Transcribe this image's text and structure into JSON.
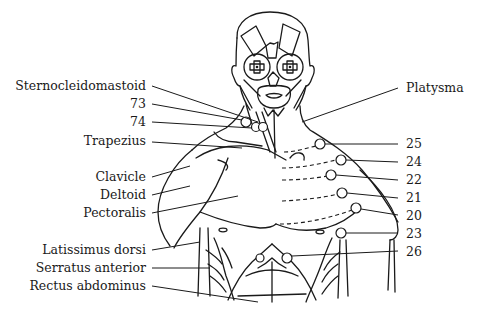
{
  "diagram": {
    "type": "anatomical-muscle-chart",
    "left_labels": [
      {
        "id": "sternocleidomastoid",
        "text": "Sternocleidomastoid",
        "x": 146,
        "y": 90
      },
      {
        "id": "73",
        "text": "73",
        "x": 146,
        "y": 108
      },
      {
        "id": "74",
        "text": "74",
        "x": 146,
        "y": 126
      },
      {
        "id": "trapezius",
        "text": "Trapezius",
        "x": 146,
        "y": 145
      },
      {
        "id": "clavicle",
        "text": "Clavicle",
        "x": 146,
        "y": 181
      },
      {
        "id": "deltoid",
        "text": "Deltoid",
        "x": 146,
        "y": 199
      },
      {
        "id": "pectoralis",
        "text": "Pectoralis",
        "x": 146,
        "y": 217
      },
      {
        "id": "latissimus-dorsi",
        "text": "Latissimus dorsi",
        "x": 146,
        "y": 254
      },
      {
        "id": "serratus-anterior",
        "text": "Serratus anterior",
        "x": 146,
        "y": 272
      },
      {
        "id": "rectus-abdominus",
        "text": "Rectus abdominus",
        "x": 146,
        "y": 290
      }
    ],
    "right_labels": [
      {
        "id": "platysma",
        "text": "Platysma",
        "x": 406,
        "y": 92
      },
      {
        "id": "25",
        "text": "25",
        "x": 406,
        "y": 148
      },
      {
        "id": "24",
        "text": "24",
        "x": 406,
        "y": 166
      },
      {
        "id": "22",
        "text": "22",
        "x": 406,
        "y": 184
      },
      {
        "id": "21",
        "text": "21",
        "x": 406,
        "y": 202
      },
      {
        "id": "20",
        "text": "20",
        "x": 406,
        "y": 220
      },
      {
        "id": "23",
        "text": "23",
        "x": 406,
        "y": 238
      },
      {
        "id": "26",
        "text": "26",
        "x": 406,
        "y": 256
      }
    ],
    "points": [
      {
        "id": "73",
        "cx": 246,
        "cy": 122
      },
      {
        "id": "74",
        "cx": 258,
        "cy": 126
      },
      {
        "id": "74b",
        "cx": 263,
        "cy": 127
      },
      {
        "id": "25",
        "cx": 320,
        "cy": 144
      },
      {
        "id": "24",
        "cx": 341,
        "cy": 160
      },
      {
        "id": "22",
        "cx": 331,
        "cy": 175
      },
      {
        "id": "21",
        "cx": 342,
        "cy": 193
      },
      {
        "id": "20",
        "cx": 356,
        "cy": 208
      },
      {
        "id": "23",
        "cx": 341,
        "cy": 233
      },
      {
        "id": "26",
        "cx": 287,
        "cy": 258
      }
    ],
    "colors": {
      "ink": "#1a1a1a",
      "background": "#ffffff"
    }
  }
}
